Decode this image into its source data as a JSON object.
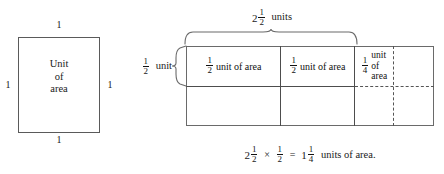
{
  "figure": {
    "unit_square": {
      "inner_label_lines": [
        "Unit",
        "of",
        "area"
      ],
      "side_labels": {
        "top": "1",
        "bottom": "1",
        "left": "1",
        "right": "1"
      }
    },
    "area_model": {
      "top_brace_label": {
        "whole": "2",
        "numerator": "1",
        "denominator": "2",
        "units_word": "units"
      },
      "left_brace_label": {
        "numerator": "1",
        "denominator": "2",
        "units_word": "unit"
      },
      "cells": [
        {
          "numerator": "1",
          "denominator": "2",
          "text": "unit of area",
          "shaded": true
        },
        {
          "numerator": "1",
          "denominator": "2",
          "text": "unit of area",
          "shaded": true
        },
        {
          "numerator": "1",
          "denominator": "4",
          "text_lines": [
            "unit",
            "of",
            "area"
          ],
          "shaded": true
        }
      ]
    },
    "equation": {
      "left_whole": "2",
      "left_num": "1",
      "left_den": "2",
      "times": "×",
      "factor_num": "1",
      "factor_den": "2",
      "equals": "=",
      "result_whole": "1",
      "result_num": "1",
      "result_den": "4",
      "trailing_text": "units of area."
    }
  },
  "colors": {
    "shade": "#dedede",
    "stroke": "#5a5a5a",
    "text": "#1a1a1a",
    "background": "#ffffff"
  }
}
